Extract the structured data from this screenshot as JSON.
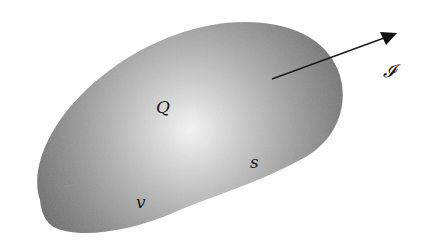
{
  "diagram": {
    "type": "control-volume",
    "region": {
      "fill_edge": "#7a7a7a",
      "fill_center": "#f4f4f4"
    },
    "labels": {
      "heat": "Q",
      "surface": "s",
      "volume": "v",
      "flux": "𝓘"
    },
    "arrow": {
      "color": "#1a1a1a",
      "from": [
        272,
        79
      ],
      "to": [
        397,
        33
      ]
    }
  }
}
